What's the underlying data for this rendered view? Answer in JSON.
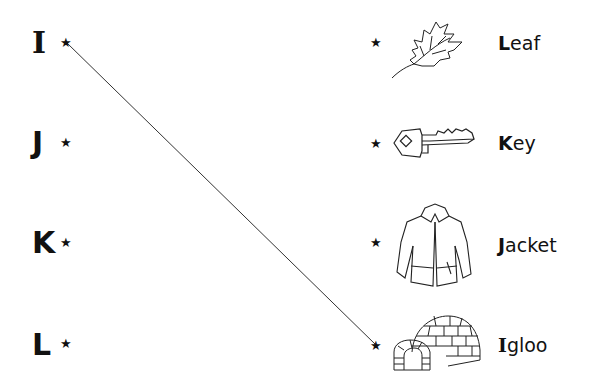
{
  "left_items": [
    {
      "letter": "I",
      "y": 28
    },
    {
      "letter": "J",
      "y": 128
    },
    {
      "letter": "K",
      "y": 228
    },
    {
      "letter": "L",
      "y": 330
    }
  ],
  "right_items": [
    {
      "first": "L",
      "rest": "eaf",
      "image": "leaf-icon"
    },
    {
      "first": "K",
      "rest": "ey",
      "image": "key-icon"
    },
    {
      "first": "J",
      "rest": "acket",
      "image": "jacket-icon"
    },
    {
      "first": "I",
      "rest": "gloo",
      "image": "igloo-icon"
    }
  ],
  "star_glyph": "★",
  "connection": {
    "from": "I",
    "to": "Igloo",
    "color": "#333333"
  }
}
